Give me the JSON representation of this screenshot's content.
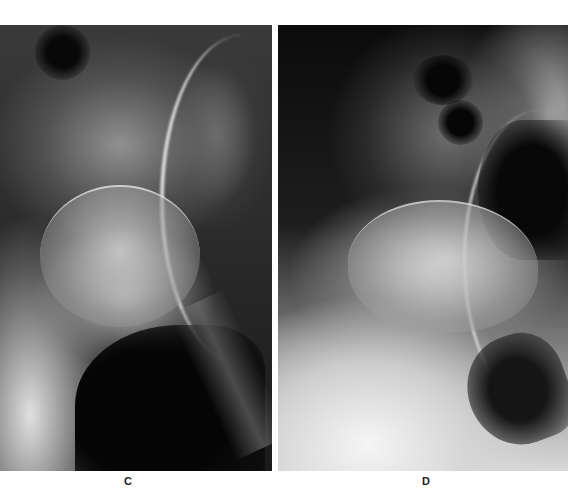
{
  "figure": {
    "panels": [
      {
        "id": "C",
        "label": "C",
        "description": "Radiograph of hip joint showing femoral head within acetabulum"
      },
      {
        "id": "D",
        "label": "D",
        "description": "Radiograph of hip joint with deformed femoral head and acetabular changes"
      }
    ],
    "caption_partial": "Fig. ... (caption cut off)"
  },
  "colors": {
    "background": "#ffffff",
    "film_dark": "#0a0a0a",
    "bone_light": "#e6e6e6",
    "label_text": "#222222"
  }
}
